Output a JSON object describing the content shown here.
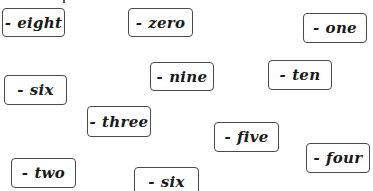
{
  "cards": [
    {
      "id": "eight",
      "prefix": "-",
      "label": "eight",
      "x": 2,
      "y": 8,
      "w": 63,
      "h": 29
    },
    {
      "id": "zero",
      "prefix": "-",
      "label": "zero",
      "x": 128,
      "y": 8,
      "w": 65,
      "h": 29
    },
    {
      "id": "one",
      "prefix": "-",
      "label": "one",
      "x": 303,
      "y": 13,
      "w": 64,
      "h": 30
    },
    {
      "id": "nine",
      "prefix": "-",
      "label": "nine",
      "x": 150,
      "y": 62,
      "w": 64,
      "h": 29
    },
    {
      "id": "ten",
      "prefix": "-",
      "label": "ten",
      "x": 268,
      "y": 60,
      "w": 64,
      "h": 30
    },
    {
      "id": "six-1",
      "prefix": "-",
      "label": "six",
      "x": 4,
      "y": 75,
      "w": 63,
      "h": 30
    },
    {
      "id": "three",
      "prefix": "-",
      "label": "three",
      "x": 87,
      "y": 106,
      "w": 64,
      "h": 31
    },
    {
      "id": "five",
      "prefix": "-",
      "label": "five",
      "x": 214,
      "y": 122,
      "w": 65,
      "h": 30
    },
    {
      "id": "four",
      "prefix": "-",
      "label": "four",
      "x": 306,
      "y": 143,
      "w": 64,
      "h": 30
    },
    {
      "id": "two",
      "prefix": "-",
      "label": "two",
      "x": 11,
      "y": 158,
      "w": 65,
      "h": 30
    },
    {
      "id": "six-2",
      "prefix": "-",
      "label": "six",
      "x": 134,
      "y": 167,
      "w": 65,
      "h": 30
    }
  ],
  "colors": {
    "background": "#ffffff",
    "border": "#4a4a4a",
    "text": "#1a1a1a"
  }
}
